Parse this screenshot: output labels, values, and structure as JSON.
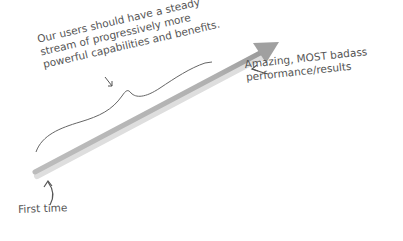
{
  "diagram": {
    "type": "growth-arrow-sketch",
    "colors": {
      "background": "#ffffff",
      "arrow": "#b5b5b5",
      "arrow_shadow": "#d9d9d9",
      "ink": "#555555"
    },
    "arrow": {
      "start": [
        35,
        172
      ],
      "end": [
        278,
        42
      ]
    },
    "annotations": {
      "stream": {
        "lines": [
          "Our users should have a steady",
          "stream of progressively more",
          "powerful capabilities and benefits."
        ]
      },
      "amazing": {
        "lines": [
          "Amazing, MOST badass",
          "performance/results"
        ]
      },
      "first": {
        "lines": [
          "First time"
        ]
      }
    }
  }
}
